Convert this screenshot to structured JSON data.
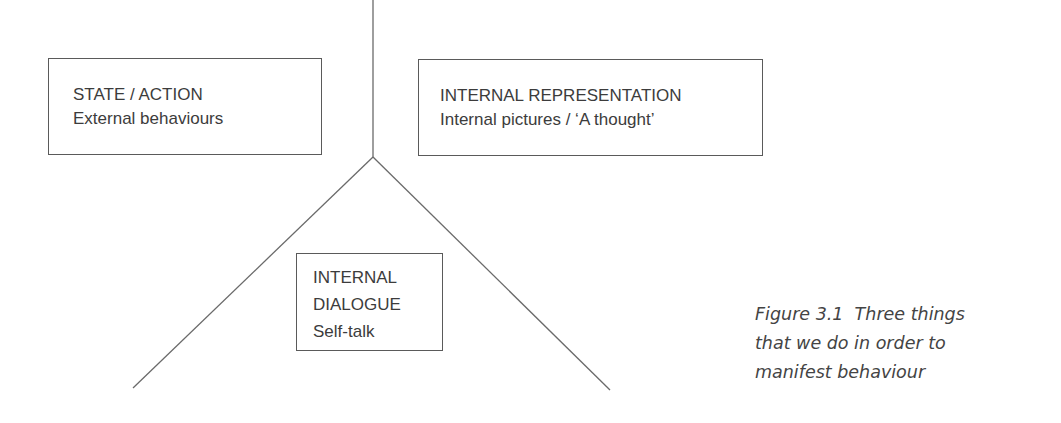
{
  "diagram": {
    "boxes": [
      {
        "id": "state-action",
        "line1": "STATE / ACTION",
        "line2": "External behaviours"
      },
      {
        "id": "internal-representation",
        "line1": "INTERNAL REPRESENTATION",
        "line2": "Internal pictures / ‘A thought’"
      },
      {
        "id": "internal-dialogue",
        "line1": "INTERNAL",
        "line2": "DIALOGUE",
        "line3": "Self-talk"
      }
    ],
    "line_color": "#6a6a6a"
  },
  "caption": {
    "label": "Figure 3.1",
    "line1": "Figure 3.1  Three things",
    "line2": "that we do in order to",
    "line3": "manifest behaviour"
  }
}
